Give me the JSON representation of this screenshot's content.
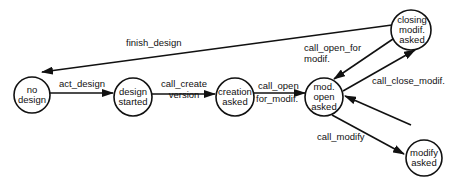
{
  "diagram": {
    "type": "state-transition",
    "nodes": [
      {
        "id": "no_design",
        "lines": [
          "no",
          "design"
        ]
      },
      {
        "id": "design_started",
        "lines": [
          "design",
          "started"
        ]
      },
      {
        "id": "creation_asked",
        "lines": [
          "creation",
          "asked"
        ]
      },
      {
        "id": "mod_open_asked",
        "lines": [
          "mod.",
          "open",
          "asked"
        ]
      },
      {
        "id": "closing_modif_asked",
        "lines": [
          "closing",
          "modif.",
          "asked"
        ]
      },
      {
        "id": "modify_asked",
        "lines": [
          "modify",
          "asked"
        ]
      }
    ],
    "edges": [
      {
        "from": "no_design",
        "to": "design_started",
        "label": "act_design"
      },
      {
        "from": "design_started",
        "to": "creation_asked",
        "label_lines": [
          "call_create",
          "version"
        ]
      },
      {
        "from": "creation_asked",
        "to": "mod_open_asked",
        "label_lines": [
          "call_open",
          "for_modif."
        ]
      },
      {
        "from": "closing_modif_asked",
        "to": "mod_open_asked",
        "label_lines": [
          "call_open_for",
          "modif."
        ]
      },
      {
        "from": "mod_open_asked",
        "to": "closing_modif_asked",
        "label": "call_close_modif."
      },
      {
        "from": "mod_open_asked",
        "to": "modify_asked",
        "label": "call_modify"
      },
      {
        "from": "modify_asked",
        "to": "mod_open_asked",
        "label": ""
      },
      {
        "from": "closing_modif_asked",
        "to": "no_design",
        "label": "finish_design"
      }
    ]
  }
}
